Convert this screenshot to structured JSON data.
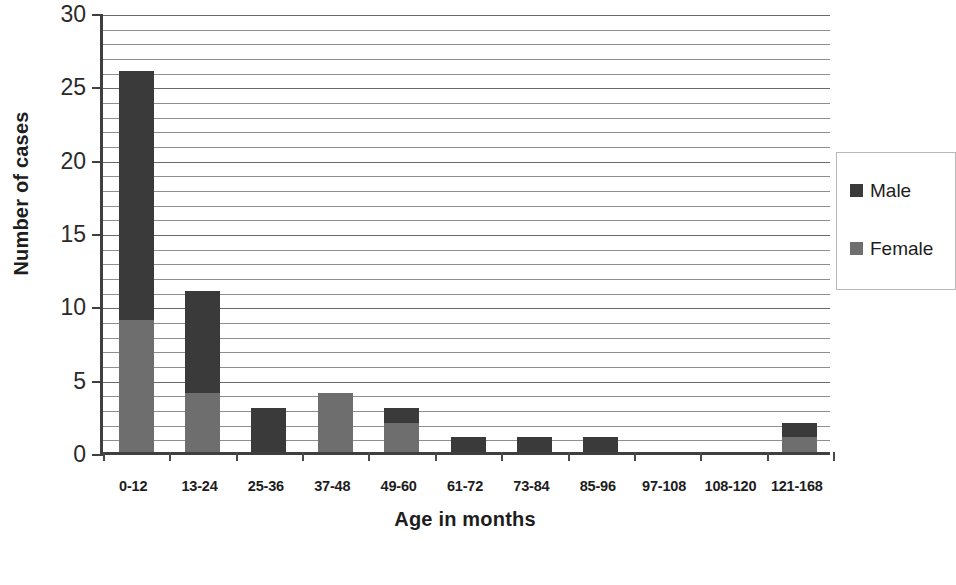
{
  "chart_data": {
    "type": "bar",
    "stacked": true,
    "title": "",
    "xlabel": "Age in months",
    "ylabel": "Number of cases",
    "categories": [
      "0-12",
      "13-24",
      "25-36",
      "37-48",
      "49-60",
      "61-72",
      "73-84",
      "85-96",
      "97-108",
      "108-120",
      "121-168"
    ],
    "series": [
      {
        "name": "Male",
        "color": "#3a3a3a",
        "values": [
          17,
          7,
          3,
          0,
          1,
          1,
          1,
          1,
          0,
          0,
          1
        ]
      },
      {
        "name": "Female",
        "color": "#6e6e6e",
        "values": [
          9,
          4,
          0,
          4,
          2,
          0,
          0,
          0,
          0,
          0,
          1
        ]
      }
    ],
    "totals": [
      26,
      11,
      3,
      4,
      3,
      1,
      1,
      1,
      0,
      0,
      2
    ],
    "ylim": [
      0,
      30
    ],
    "y_major_ticks": [
      0,
      5,
      10,
      15,
      20,
      25,
      30
    ],
    "y_tick_labels": [
      "0",
      "5",
      "10",
      "15",
      "20",
      "25",
      "30"
    ],
    "y_minor_step": 1,
    "grid": true,
    "grid_axis": "y",
    "legend_position": "right"
  },
  "legend": {
    "entries": [
      {
        "label": "Male",
        "color": "#3a3a3a"
      },
      {
        "label": "Female",
        "color": "#6e6e6e"
      }
    ]
  },
  "axes": {
    "y_title": "Number of cases",
    "x_title": "Age in months"
  }
}
